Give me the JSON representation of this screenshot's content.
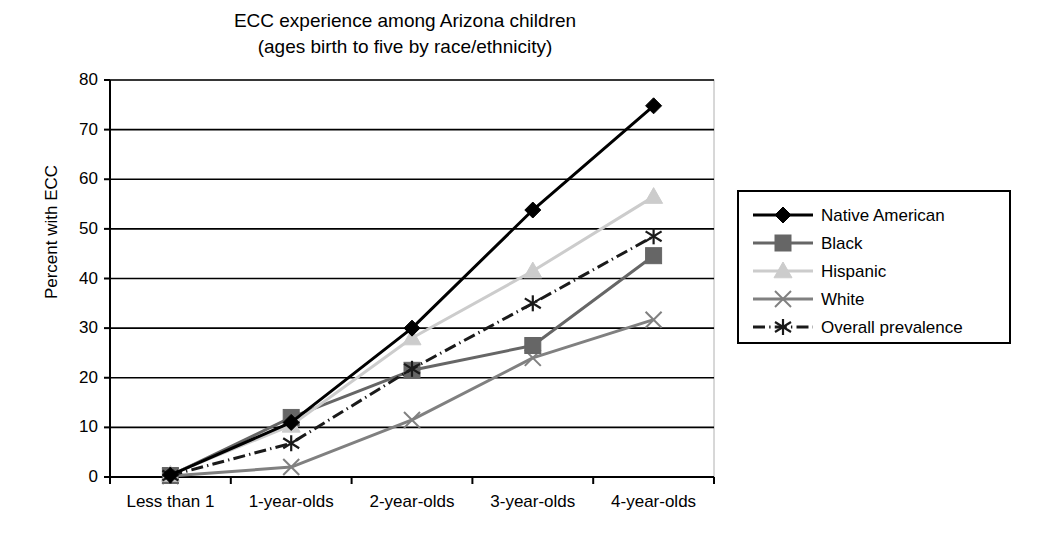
{
  "chart_data": {
    "type": "line",
    "title": "ECC experience among Arizona children (ages birth to five by race/ethnicity)",
    "title_line1": "ECC experience among Arizona children",
    "title_line2": "(ages birth to five by race/ethnicity)",
    "xlabel": "",
    "ylabel": "Percent with ECC",
    "categories": [
      "Less than 1",
      "1-year-olds",
      "2-year-olds",
      "3-year-olds",
      "4-year-olds"
    ],
    "ylim": [
      0,
      80
    ],
    "yticks": [
      0,
      10,
      20,
      30,
      40,
      50,
      60,
      70,
      80
    ],
    "ytick_labels": [
      "0",
      "10",
      "20",
      "30",
      "40",
      "50",
      "60",
      "70",
      "80"
    ],
    "grid": "horizontal",
    "legend_position": "right",
    "series": [
      {
        "name": "Native American",
        "values": [
          0.4,
          11.0,
          30.0,
          53.8,
          74.8
        ],
        "color": "#000000",
        "marker": "diamond",
        "dash": "solid",
        "width": 3
      },
      {
        "name": "Black",
        "values": [
          0.3,
          12.0,
          21.5,
          26.5,
          44.6
        ],
        "color": "#666666",
        "marker": "square",
        "dash": "solid",
        "width": 3
      },
      {
        "name": "Hispanic",
        "values": [
          0.5,
          10.4,
          28.0,
          41.5,
          56.5
        ],
        "color": "#cccccc",
        "marker": "triangle",
        "dash": "solid",
        "width": 3
      },
      {
        "name": "White",
        "values": [
          0.2,
          2.0,
          11.5,
          24.0,
          31.7
        ],
        "color": "#808080",
        "marker": "x",
        "dash": "solid",
        "width": 3
      },
      {
        "name": "Overall prevalence",
        "values": [
          0.3,
          6.8,
          21.8,
          35.0,
          48.5
        ],
        "color": "#1a1a1a",
        "marker": "asterisk",
        "dash": "dashdot",
        "width": 3
      }
    ]
  },
  "colors": {
    "axis": "#000000",
    "gridline": "#000000",
    "plot_border": "#b0b0b0",
    "background": "#ffffff"
  }
}
